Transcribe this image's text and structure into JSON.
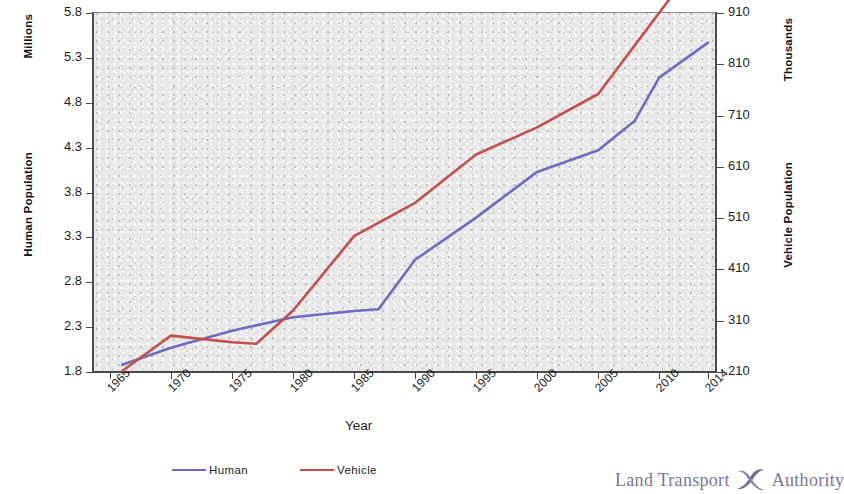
{
  "chart_data": {
    "type": "line",
    "title": "",
    "xlabel": "Year",
    "x": [
      1965,
      1970,
      1975,
      1980,
      1985,
      1990,
      1995,
      2000,
      2005,
      2010,
      2014
    ],
    "xtick_labels": [
      "1965",
      "1970",
      "1975",
      "1980",
      "1985",
      "1990",
      "1995",
      "2000",
      "2005",
      "2010",
      "2014"
    ],
    "grid": false,
    "legend_position": "bottom",
    "axes": {
      "left": {
        "label": "Human Population",
        "unit": "Millions",
        "ylim": [
          1.8,
          5.8
        ],
        "step": 0.5,
        "ticks": [
          "5.8",
          "5.3",
          "4.8",
          "4.3",
          "3.8",
          "3.3",
          "2.8",
          "2.3",
          "1.8"
        ],
        "tick_values": [
          5.8,
          5.3,
          4.8,
          4.3,
          3.8,
          3.3,
          2.8,
          2.3,
          1.8
        ]
      },
      "right": {
        "label": "Vehicle Population",
        "unit": "Thousands",
        "ylim": [
          210,
          910
        ],
        "step": 100,
        "ticks": [
          "910",
          "810",
          "710",
          "610",
          "510",
          "410",
          "310",
          "210"
        ],
        "tick_values": [
          910,
          810,
          710,
          610,
          510,
          410,
          310,
          210
        ]
      }
    },
    "series": [
      {
        "name": "Human",
        "axis": "left",
        "color": "#6f6cc0",
        "unit": "Millions",
        "points": [
          {
            "year": 1966,
            "value": 1.88
          },
          {
            "year": 1970,
            "value": 2.07
          },
          {
            "year": 1975,
            "value": 2.26
          },
          {
            "year": 1980,
            "value": 2.41
          },
          {
            "year": 1985,
            "value": 2.48
          },
          {
            "year": 1987,
            "value": 2.5
          },
          {
            "year": 1990,
            "value": 3.05
          },
          {
            "year": 1995,
            "value": 3.52
          },
          {
            "year": 2000,
            "value": 4.03
          },
          {
            "year": 2005,
            "value": 4.27
          },
          {
            "year": 2008,
            "value": 4.6
          },
          {
            "year": 2010,
            "value": 5.08
          },
          {
            "year": 2014,
            "value": 5.47
          }
        ]
      },
      {
        "name": "Vehicle",
        "axis": "right",
        "color": "#c2504b",
        "unit": "Thousands",
        "points": [
          {
            "year": 1966,
            "value": 212
          },
          {
            "year": 1970,
            "value": 281
          },
          {
            "year": 1975,
            "value": 268
          },
          {
            "year": 1977,
            "value": 265
          },
          {
            "year": 1980,
            "value": 330
          },
          {
            "year": 1985,
            "value": 475
          },
          {
            "year": 1990,
            "value": 540
          },
          {
            "year": 1995,
            "value": 634
          },
          {
            "year": 2000,
            "value": 687
          },
          {
            "year": 2005,
            "value": 752
          },
          {
            "year": 2011,
            "value": 942
          },
          {
            "year": 2014,
            "value": 960
          }
        ]
      }
    ],
    "legend": [
      {
        "label": "Human",
        "color": "#6f6cc0"
      },
      {
        "label": "Vehicle",
        "color": "#c2504b"
      }
    ]
  },
  "logo": {
    "left_word": "Land Transport",
    "right_word": "Authority",
    "mark": "lta-swoosh-icon",
    "color": "#7a7794"
  }
}
